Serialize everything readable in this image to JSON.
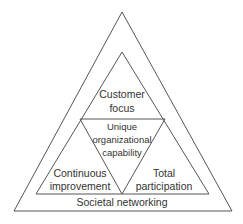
{
  "diagram": {
    "outer_label": "Societal networking",
    "top_section": {
      "line1": "Customer",
      "line2": "focus"
    },
    "center_section": {
      "line1": "Unique",
      "line2": "organizational",
      "line3": "capability"
    },
    "left_section": {
      "line1": "Continuous",
      "line2": "improvement"
    },
    "right_section": {
      "line1": "Total",
      "line2": "participation"
    },
    "line_color": "#555555",
    "text_color": "#333333"
  }
}
